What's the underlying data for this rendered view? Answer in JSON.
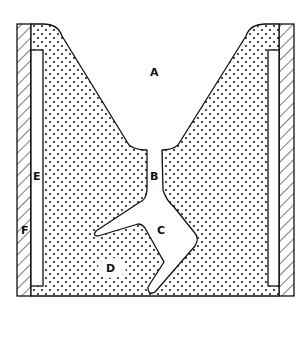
{
  "diagram": {
    "type": "cross-section",
    "labels": {
      "A": "A",
      "B": "B",
      "C": "C",
      "D": "D",
      "E": "E",
      "F": "F"
    },
    "regions": [
      {
        "id": "A",
        "description": "open funnel / pouring cup region"
      },
      {
        "id": "B",
        "description": "narrow neck / sprue"
      },
      {
        "id": "C",
        "description": "irregular cavity"
      },
      {
        "id": "D",
        "description": "stippled fill region"
      },
      {
        "id": "E",
        "description": "inner white liner strip"
      },
      {
        "id": "F",
        "description": "hatched outer wall"
      }
    ],
    "colors": {
      "stroke": "#111111",
      "fill_background": "#ffffff",
      "stipple_dot": "#222222"
    }
  }
}
